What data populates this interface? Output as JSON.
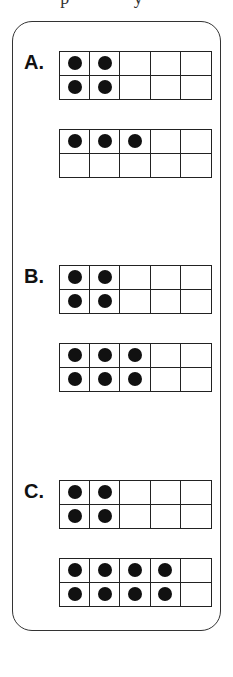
{
  "header": {
    "fragment": "p   y"
  },
  "colors": {
    "ink": "#111111",
    "border": "#222222",
    "background": "#ffffff"
  },
  "problems": [
    {
      "label": "A.",
      "frames": [
        {
          "filled": [
            true,
            true,
            false,
            false,
            false,
            true,
            true,
            false,
            false,
            false
          ],
          "count": 4
        },
        {
          "filled": [
            true,
            true,
            true,
            false,
            false,
            false,
            false,
            false,
            false,
            false
          ],
          "count": 3
        }
      ]
    },
    {
      "label": "B.",
      "frames": [
        {
          "filled": [
            true,
            true,
            false,
            false,
            false,
            true,
            true,
            false,
            false,
            false
          ],
          "count": 4
        },
        {
          "filled": [
            true,
            true,
            true,
            false,
            false,
            true,
            true,
            true,
            false,
            false
          ],
          "count": 6
        }
      ]
    },
    {
      "label": "C.",
      "frames": [
        {
          "filled": [
            true,
            true,
            false,
            false,
            false,
            true,
            true,
            false,
            false,
            false
          ],
          "count": 4
        },
        {
          "filled": [
            true,
            true,
            true,
            true,
            false,
            true,
            true,
            true,
            true,
            false
          ],
          "count": 8
        }
      ]
    }
  ]
}
